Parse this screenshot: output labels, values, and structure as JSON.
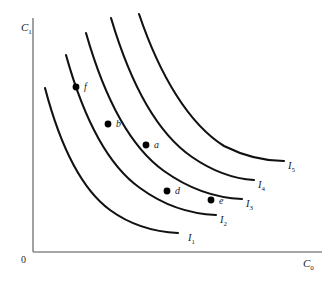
{
  "figure": {
    "background_color": "#ffffff",
    "curve_color": "#111111",
    "axis_color": "#8a8a8a",
    "point_color": "#000000"
  },
  "axes": {
    "origin_label": "0",
    "y_axis": {
      "label_base": "C",
      "label_sub": "1",
      "label_full": "C1"
    },
    "x_axis": {
      "label_base": "C",
      "label_sub": "0",
      "label_full": "C0"
    }
  },
  "chart_data": {
    "type": "line",
    "xlabel": "C0",
    "ylabel": "C1",
    "grid": false,
    "legend_position": "inline-right-of-curve",
    "series": [
      {
        "name": "I1",
        "label_base": "I",
        "label_sub": "1",
        "label_x": 188,
        "label_y": 233,
        "path": "M 45,88 C 60,145 80,188 110,210 C 132,226 156,232 178,233"
      },
      {
        "name": "I2",
        "label_base": "I",
        "label_sub": "2",
        "label_x": 220,
        "label_y": 215,
        "path": "M 66,55 C 83,116 106,164 140,188 C 166,207 192,214 216,215"
      },
      {
        "name": "I3",
        "label_base": "I",
        "label_sub": "3",
        "label_x": 246,
        "label_y": 199,
        "path": "M 86,33 C 104,96 129,146 164,171 C 192,191 218,198 242,199"
      },
      {
        "name": "I4",
        "label_base": "I",
        "label_sub": "4",
        "label_x": 258,
        "label_y": 180,
        "path": "M 111,18 C 130,82 157,133 192,157 C 218,175 238,179 254,180"
      },
      {
        "name": "I5",
        "label_base": "I",
        "label_sub": "5",
        "label_x": 288,
        "label_y": 161,
        "path": "M 139,14 C 160,76 189,124 224,146 C 250,159 270,161 284,161"
      }
    ],
    "points": [
      {
        "name": "f",
        "label": "f",
        "x": 76,
        "y": 87,
        "label_x": 84,
        "label_y": 82,
        "on_curve": "I2"
      },
      {
        "name": "b",
        "label": "b",
        "x": 108,
        "y": 124,
        "label_x": 116,
        "label_y": 119,
        "on_curve": "I3"
      },
      {
        "name": "a",
        "label": "a",
        "x": 146,
        "y": 145,
        "label_x": 154,
        "label_y": 140,
        "on_curve": "I3"
      },
      {
        "name": "d",
        "label": "d",
        "x": 167,
        "y": 191,
        "label_x": 175,
        "label_y": 186,
        "on_curve": "I2"
      },
      {
        "name": "e",
        "label": "e",
        "x": 211,
        "y": 200,
        "label_x": 219,
        "label_y": 196,
        "on_curve": "I3"
      }
    ],
    "annotations": []
  }
}
